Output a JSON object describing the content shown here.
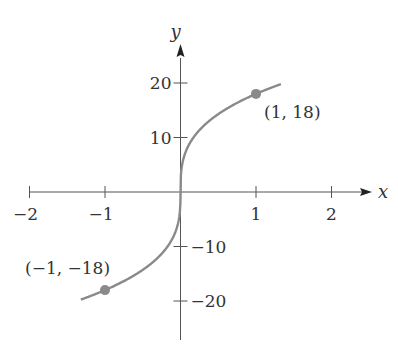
{
  "chart_data": {
    "type": "line",
    "title": "",
    "xlabel": "x",
    "ylabel": "y",
    "function": "y = 18 * cbrt(x)",
    "xlim": [
      -2.2,
      2.5
    ],
    "ylim": [
      -25,
      28
    ],
    "x_ticks": [
      -2,
      -1,
      1,
      2
    ],
    "x_tick_labels": [
      "−2",
      "−1",
      "1",
      "2"
    ],
    "y_ticks": [
      20,
      10,
      -10,
      -20
    ],
    "y_tick_labels": [
      "20",
      "10",
      "−10",
      "−20"
    ],
    "grid": false,
    "series": [
      {
        "name": "curve",
        "x_range": [
          -1.32,
          1.33
        ],
        "color": "#8a8a8a"
      }
    ],
    "points": [
      {
        "x": 1,
        "y": 18,
        "label": "(1, 18)"
      },
      {
        "x": -1,
        "y": -18,
        "label": "(−1, −18)"
      }
    ]
  },
  "colors": {
    "axis": "#555555",
    "curve": "#8a8a8a",
    "point": "#8a8a8a",
    "text": "#333333"
  }
}
